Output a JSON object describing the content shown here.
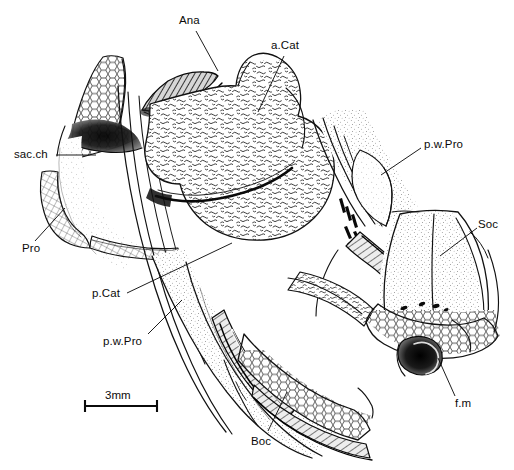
{
  "figure": {
    "kind": "anatomical-line-drawing",
    "background_color": "#ffffff",
    "ink_color": "#000000",
    "width": 514,
    "height": 470
  },
  "scale_bar": {
    "label": "3mm",
    "value": 3,
    "unit": "mm",
    "x1": 84,
    "x2": 158,
    "y": 406,
    "label_x": 105,
    "label_y": 390
  },
  "labels": [
    {
      "id": "ana",
      "text": "Ana",
      "x": 179,
      "y": 15,
      "anchor": "start",
      "leader": [
        [
          196,
          31
        ],
        [
          218,
          71
        ]
      ],
      "meaning": "anocleithrum / anterior element"
    },
    {
      "id": "a-cat",
      "text": "a.Cat",
      "x": 271,
      "y": 40,
      "anchor": "start",
      "leader": [
        [
          284,
          56
        ],
        [
          258,
          112
        ]
      ],
      "meaning": "anterior catazygal"
    },
    {
      "id": "sac-ch",
      "text": "sac.ch",
      "x": 14,
      "y": 149,
      "anchor": "start",
      "leader": [
        [
          56,
          155
        ],
        [
          96,
          155
        ]
      ],
      "meaning": "sacculus chamber"
    },
    {
      "id": "pro",
      "text": "Pro",
      "x": 22,
      "y": 243,
      "anchor": "start",
      "leader": [
        [
          35,
          241
        ],
        [
          65,
          208
        ]
      ],
      "meaning": "prootic"
    },
    {
      "id": "p-cat",
      "text": "p.Cat",
      "x": 92,
      "y": 288,
      "anchor": "start",
      "leader": [
        [
          127,
          293
        ],
        [
          232,
          243
        ]
      ],
      "meaning": "posterior catazygal"
    },
    {
      "id": "p-w-pro-left",
      "text": "p.w.Pro",
      "x": 103,
      "y": 336,
      "anchor": "start",
      "leader": [
        [
          148,
          334
        ],
        [
          182,
          300
        ]
      ],
      "meaning": "posterior wall of prootic (left view)"
    },
    {
      "id": "boc",
      "text": "Boc",
      "x": 251,
      "y": 436,
      "anchor": "start",
      "leader": [
        [
          268,
          431
        ],
        [
          287,
          392
        ]
      ],
      "meaning": "basioccipital"
    },
    {
      "id": "p-w-pro-right",
      "text": "p.w.Pro",
      "x": 424,
      "y": 139,
      "anchor": "start",
      "leader": [
        [
          421,
          148
        ],
        [
          381,
          175
        ]
      ],
      "meaning": "posterior wall of prootic (right view)"
    },
    {
      "id": "soc",
      "text": "Soc",
      "x": 478,
      "y": 219,
      "anchor": "start",
      "leader": [
        [
          477,
          228
        ],
        [
          440,
          256
        ]
      ],
      "meaning": "supraoccipital"
    },
    {
      "id": "f-m",
      "text": "f.m",
      "x": 455,
      "y": 398,
      "anchor": "start",
      "leader": [
        [
          455,
          396
        ],
        [
          438,
          358
        ]
      ],
      "meaning": "foramen magnum"
    }
  ]
}
